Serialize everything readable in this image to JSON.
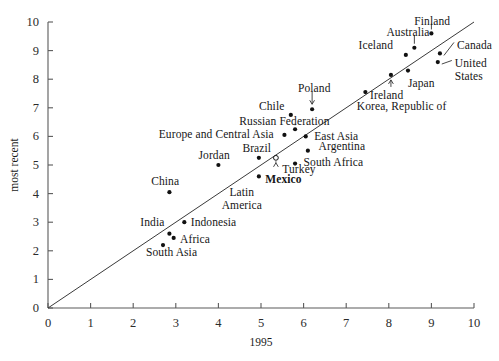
{
  "chart_data": {
    "type": "scatter",
    "title": "",
    "xlabel": "1995",
    "ylabel": "most recent",
    "xlim": [
      0,
      10
    ],
    "ylim": [
      0,
      10
    ],
    "xticks": [
      "0",
      "1",
      "2",
      "3",
      "4",
      "5",
      "6",
      "7",
      "8",
      "9",
      "10"
    ],
    "yticks": [
      "0",
      "1",
      "2",
      "3",
      "4",
      "5",
      "6",
      "7",
      "8",
      "9",
      "10"
    ],
    "grid": false,
    "legend": "none",
    "reference_line": {
      "name": "45-degree-line",
      "description": "y = x diagonal line",
      "from": [
        0,
        0
      ],
      "to": [
        10,
        10
      ]
    },
    "points": [
      {
        "label": "Finland",
        "x": 9.0,
        "y": 9.6,
        "marker": "filled",
        "label_x": 9.02,
        "label_y": 10.05,
        "anchor": "center",
        "bold": false,
        "leader": "vertical"
      },
      {
        "label": "Australia",
        "x": 8.6,
        "y": 9.1,
        "marker": "filled",
        "label_x": 8.45,
        "label_y": 9.65,
        "anchor": "center",
        "bold": false,
        "leader": "vertical"
      },
      {
        "label": "Iceland",
        "x": 8.4,
        "y": 8.85,
        "marker": "filled",
        "label_x": 8.1,
        "label_y": 9.2,
        "anchor": "right",
        "bold": false,
        "leader": "none"
      },
      {
        "label": "Canada",
        "x": 9.2,
        "y": 8.9,
        "marker": "filled",
        "label_x": 9.6,
        "label_y": 9.18,
        "anchor": "left",
        "bold": false,
        "leader": "diagonal"
      },
      {
        "label": "United States",
        "x": 9.15,
        "y": 8.6,
        "marker": "filled",
        "label_x": 9.55,
        "label_y": 8.55,
        "anchor": "left",
        "bold": false,
        "leader": "diagonal"
      },
      {
        "label": "Japan",
        "x": 8.45,
        "y": 8.3,
        "marker": "filled",
        "label_x": 8.45,
        "label_y": 7.85,
        "anchor": "left",
        "bold": false,
        "leader": "none"
      },
      {
        "label": "Ireland",
        "x": 8.05,
        "y": 8.15,
        "marker": "filled",
        "label_x": 7.95,
        "label_y": 7.45,
        "anchor": "center",
        "bold": false,
        "leader": "arrow-up"
      },
      {
        "label": "Korea, Republic of",
        "x": 7.45,
        "y": 7.55,
        "marker": "filled",
        "label_x": 8.3,
        "label_y": 7.05,
        "anchor": "center",
        "bold": false,
        "leader": "none"
      },
      {
        "label": "Poland",
        "x": 6.2,
        "y": 6.95,
        "marker": "filled",
        "label_x": 6.25,
        "label_y": 7.7,
        "anchor": "center",
        "bold": false,
        "leader": "arrow-down"
      },
      {
        "label": "Chile",
        "x": 5.7,
        "y": 6.75,
        "marker": "filled",
        "label_x": 5.55,
        "label_y": 7.05,
        "anchor": "right",
        "bold": false,
        "leader": "none"
      },
      {
        "label": "Russian Federation",
        "x": 5.8,
        "y": 6.25,
        "marker": "filled",
        "label_x": 5.55,
        "label_y": 6.55,
        "anchor": "center",
        "bold": false,
        "leader": "vertical"
      },
      {
        "label": "Europe and Central Asia",
        "x": 5.55,
        "y": 6.05,
        "marker": "filled",
        "label_x": 5.3,
        "label_y": 6.1,
        "anchor": "right",
        "bold": false,
        "leader": "none"
      },
      {
        "label": "East Asia",
        "x": 6.05,
        "y": 6.0,
        "marker": "filled",
        "label_x": 6.25,
        "label_y": 6.0,
        "anchor": "left",
        "bold": false,
        "leader": "none"
      },
      {
        "label": "Argentina",
        "x": 6.1,
        "y": 5.5,
        "marker": "filled",
        "label_x": 6.35,
        "label_y": 5.65,
        "anchor": "left",
        "bold": false,
        "leader": "none"
      },
      {
        "label": "Brazil",
        "x": 4.95,
        "y": 5.25,
        "marker": "filled",
        "label_x": 4.9,
        "label_y": 5.6,
        "anchor": "center",
        "bold": false,
        "leader": "none"
      },
      {
        "label": "Jordan",
        "x": 4.0,
        "y": 5.0,
        "marker": "filled",
        "label_x": 3.9,
        "label_y": 5.35,
        "anchor": "center",
        "bold": false,
        "leader": "none"
      },
      {
        "label": "South Africa",
        "x": 5.8,
        "y": 5.05,
        "marker": "filled",
        "label_x": 6.0,
        "label_y": 5.1,
        "anchor": "left",
        "bold": false,
        "leader": "none"
      },
      {
        "label": "Turkey",
        "x": 5.35,
        "y": 5.25,
        "marker": "open",
        "label_x": 5.5,
        "label_y": 4.85,
        "anchor": "left",
        "bold": false,
        "leader": "arrow-up"
      },
      {
        "label": "Mexico",
        "x": 4.95,
        "y": 4.6,
        "marker": "filled",
        "label_x": 5.1,
        "label_y": 4.5,
        "anchor": "left",
        "bold": true,
        "leader": "none"
      },
      {
        "label": "Latin America",
        "x": 4.95,
        "y": 4.6,
        "marker": "none",
        "label_x": 4.55,
        "label_y": 4.05,
        "anchor": "center",
        "bold": false,
        "leader": "none"
      },
      {
        "label": "China",
        "x": 2.85,
        "y": 4.05,
        "marker": "filled",
        "label_x": 2.75,
        "label_y": 4.45,
        "anchor": "center",
        "bold": false,
        "leader": "none"
      },
      {
        "label": "Indonesia",
        "x": 3.2,
        "y": 3.0,
        "marker": "filled",
        "label_x": 3.35,
        "label_y": 3.0,
        "anchor": "left",
        "bold": false,
        "leader": "none"
      },
      {
        "label": "India",
        "x": 2.85,
        "y": 2.6,
        "marker": "filled",
        "label_x": 2.45,
        "label_y": 3.02,
        "anchor": "center",
        "bold": false,
        "leader": "none"
      },
      {
        "label": "Africa",
        "x": 2.95,
        "y": 2.45,
        "marker": "filled",
        "label_x": 3.1,
        "label_y": 2.4,
        "anchor": "left",
        "bold": false,
        "leader": "none"
      },
      {
        "label": "South Asia",
        "x": 2.7,
        "y": 2.2,
        "marker": "filled",
        "label_x": 2.9,
        "label_y": 1.95,
        "anchor": "center",
        "bold": false,
        "leader": "none"
      }
    ]
  }
}
